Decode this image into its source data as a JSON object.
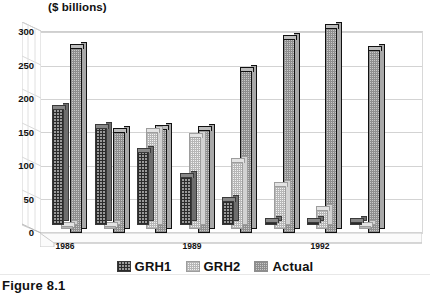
{
  "caption": "Figure 8.1",
  "chart_data": {
    "type": "bar",
    "title": "",
    "ylabel": "($ billions)",
    "xlabel": "",
    "ylim": [
      0,
      325
    ],
    "yticks": [
      0,
      50,
      100,
      150,
      200,
      250,
      300
    ],
    "ytick_labels": [
      "0",
      "50",
      "100",
      "150",
      "200",
      "250",
      "300"
    ],
    "grid": true,
    "legend_position": "bottom",
    "categories": [
      "1986",
      "1987",
      "1988",
      "1989",
      "1990",
      "1991",
      "1992",
      "1993"
    ],
    "visible_tick_labels": [
      "1986",
      "1989",
      "1992"
    ],
    "series": [
      {
        "name": "GRH1",
        "pattern": "dark-crosshatch",
        "values": [
          172,
          144,
          108,
          72,
          36,
          0,
          0,
          0
        ]
      },
      {
        "name": "GRH2",
        "pattern": "light-dots",
        "values": [
          0,
          0,
          144,
          136,
          100,
          64,
          28,
          0
        ]
      },
      {
        "name": "Actual",
        "pattern": "gray-dots-outline",
        "values": [
          275,
          150,
          155,
          153,
          240,
          288,
          305,
          272
        ]
      }
    ]
  },
  "legend": {
    "items": [
      {
        "label": "GRH1",
        "swatch": "dark-crosshatch-swatch"
      },
      {
        "label": "GRH2",
        "swatch": "light-dots-swatch"
      },
      {
        "label": "Actual",
        "swatch": "gray-dots-swatch"
      }
    ]
  },
  "colors": {
    "grh1": "#2b2b2b",
    "grh2": "#b6b6b6",
    "actual": "#8e8e8e",
    "grid": "#d3d3d3",
    "axis": "#b9b9b9",
    "text": "#111111"
  }
}
